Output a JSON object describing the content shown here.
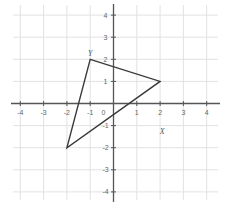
{
  "chart_data": {
    "type": "line",
    "title": "",
    "xlabel": "",
    "ylabel": "",
    "xlim": [
      -4,
      4
    ],
    "ylim": [
      -4,
      4
    ],
    "grid": true,
    "x_ticks": [
      -4,
      -3,
      -2,
      -1,
      0,
      1,
      2,
      3,
      4
    ],
    "y_ticks": [
      -4,
      -3,
      -2,
      -1,
      1,
      2,
      3,
      4
    ],
    "x_tick_labels": [
      "-4",
      "-3",
      "-2",
      "-1",
      "0",
      "1",
      "2",
      "3",
      "4"
    ],
    "y_tick_labels": [
      "-4",
      "-3",
      "-2",
      "-1",
      "1",
      "2",
      "3",
      "4"
    ],
    "series": [
      {
        "name": "triangle",
        "closed": true,
        "points": [
          {
            "x": -1,
            "y": 2
          },
          {
            "x": 2,
            "y": 1
          },
          {
            "x": -2,
            "y": -2
          }
        ]
      }
    ],
    "annotations": [
      {
        "text": "Y",
        "x": -1,
        "y": 2,
        "position": "above"
      },
      {
        "text": "X",
        "x": 2,
        "y": -1.2,
        "position": "below-right"
      }
    ],
    "colors": {
      "grid": "#e2e2e2",
      "axis": "#555555",
      "shape": "#3a3a3a"
    }
  }
}
